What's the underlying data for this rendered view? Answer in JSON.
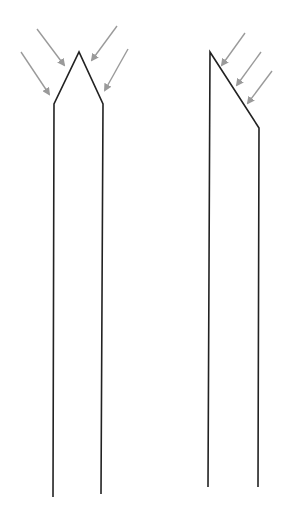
{
  "diagram": {
    "width": 282,
    "height": 513,
    "colors": {
      "background": "#ffffff",
      "outline": "#222222",
      "arrow": "#9a9a9a"
    },
    "shapes": [
      {
        "name": "symmetric-pointed-tip",
        "points": [
          [
            53,
            497
          ],
          [
            54,
            104
          ],
          [
            79,
            52
          ],
          [
            103,
            104
          ],
          [
            101,
            494
          ]
        ],
        "arrows": [
          {
            "from": [
              37,
              29
            ],
            "to": [
              64,
              65
            ]
          },
          {
            "from": [
              21,
              52
            ],
            "to": [
              49,
              94
            ]
          },
          {
            "from": [
              117,
              26
            ],
            "to": [
              92,
              60
            ]
          },
          {
            "from": [
              128,
              49
            ],
            "to": [
              105,
              90
            ]
          }
        ]
      },
      {
        "name": "bevelled-tip",
        "points": [
          [
            208,
            487
          ],
          [
            210,
            52
          ],
          [
            259,
            128
          ],
          [
            258,
            487
          ]
        ],
        "arrows": [
          {
            "from": [
              245,
              33
            ],
            "to": [
              222,
              65
            ]
          },
          {
            "from": [
              261,
              52
            ],
            "to": [
              237,
              85
            ]
          },
          {
            "from": [
              272,
              71
            ],
            "to": [
              248,
              103
            ]
          }
        ]
      }
    ]
  }
}
